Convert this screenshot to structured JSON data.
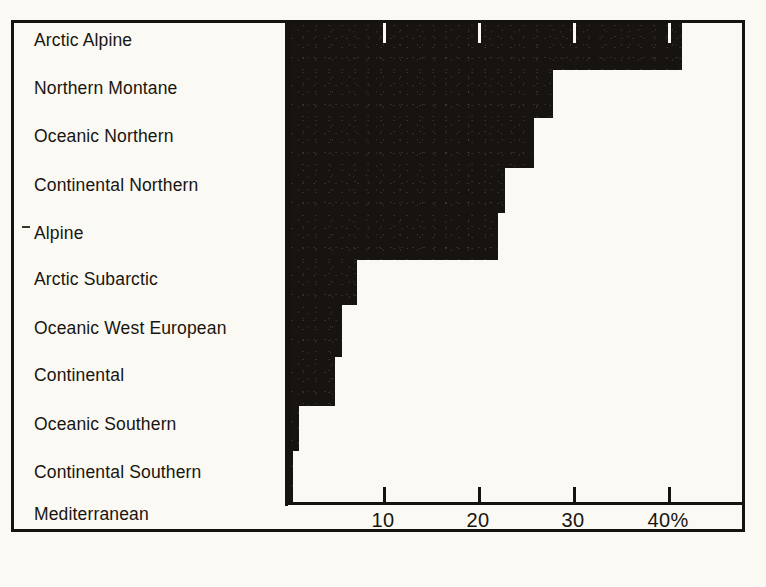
{
  "chart_data": {
    "type": "bar",
    "orientation": "horizontal",
    "title": "",
    "subtitle": "",
    "xlabel": "",
    "ylabel": "",
    "xlim": [
      0,
      47.8
    ],
    "grid": false,
    "legend": null,
    "axis_unit": "%",
    "categories": [
      "Arctic Alpine",
      "Northern Montane",
      "Oceanic Northern",
      "Continental Northern",
      "Alpine",
      "Arctic Subarctic",
      "Oceanic West European",
      "Continental",
      "Oceanic Southern",
      "Continental Southern",
      "Mediterranean"
    ],
    "values": [
      41.5,
      27.9,
      25.9,
      22.8,
      22.1,
      7.3,
      5.7,
      4.9,
      1.2,
      0.5,
      0.5
    ],
    "tick_values": [
      10,
      20,
      30,
      40
    ],
    "tick_labels": [
      "10",
      "20",
      "30",
      "40%"
    ],
    "bar_color": "#171310",
    "background_color": "#fbf9f3",
    "axis_color": "#151210"
  },
  "axis": {
    "ticks": [
      {
        "value": 10,
        "label": "10"
      },
      {
        "value": 20,
        "label": "20"
      },
      {
        "value": 30,
        "label": "30"
      },
      {
        "value": 40,
        "label": "40%"
      }
    ]
  },
  "labels": {
    "items": [
      {
        "text": "Arctic Alpine"
      },
      {
        "text": "Northern Montane"
      },
      {
        "text": "Oceanic Northern"
      },
      {
        "text": "Continental Northern"
      },
      {
        "text": "Alpine"
      },
      {
        "text": "Arctic Subarctic"
      },
      {
        "text": "Oceanic West European"
      },
      {
        "text": "Continental"
      },
      {
        "text": "Oceanic Southern"
      },
      {
        "text": "Continental Southern"
      },
      {
        "text": "Mediterranean"
      }
    ]
  }
}
